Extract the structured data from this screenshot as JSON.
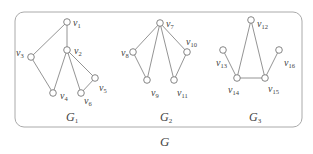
{
  "figure": {
    "caption": "G",
    "frame": {
      "x": 15,
      "y": 12,
      "w": 287,
      "h": 115,
      "r": 9,
      "stroke": "#aaaaaa"
    },
    "components": [
      {
        "name": "G1",
        "label": "G",
        "sub": "1",
        "lx": 66,
        "ly": 121
      },
      {
        "name": "G2",
        "label": "G",
        "sub": "2",
        "lx": 160,
        "ly": 121
      },
      {
        "name": "G3",
        "label": "G",
        "sub": "3",
        "lx": 249,
        "ly": 121
      }
    ],
    "vertices": [
      {
        "id": "v1",
        "sub": "1",
        "x": 67,
        "y": 22,
        "lx": 73,
        "ly": 26
      },
      {
        "id": "v2",
        "sub": "2",
        "x": 67,
        "y": 50,
        "lx": 74,
        "ly": 54
      },
      {
        "id": "v3",
        "sub": "3",
        "x": 31,
        "y": 57,
        "lx": 16,
        "ly": 56
      },
      {
        "id": "v4",
        "sub": "4",
        "x": 53,
        "y": 93,
        "lx": 60,
        "ly": 99
      },
      {
        "id": "v5",
        "sub": "5",
        "x": 95,
        "y": 78,
        "lx": 99,
        "ly": 91
      },
      {
        "id": "v6",
        "sub": "6",
        "x": 81,
        "y": 93,
        "lx": 84,
        "ly": 104
      },
      {
        "id": "v7",
        "sub": "7",
        "x": 160,
        "y": 23,
        "lx": 166,
        "ly": 27
      },
      {
        "id": "v8",
        "sub": "8",
        "x": 133,
        "y": 52,
        "lx": 121,
        "ly": 56
      },
      {
        "id": "v9",
        "sub": "9",
        "x": 147,
        "y": 80,
        "lx": 151,
        "ly": 96
      },
      {
        "id": "v10",
        "sub": "10",
        "x": 187,
        "y": 52,
        "lx": 186,
        "ly": 45
      },
      {
        "id": "v11",
        "sub": "11",
        "x": 174,
        "y": 80,
        "lx": 177,
        "ly": 96
      },
      {
        "id": "v12",
        "sub": "12",
        "x": 251,
        "y": 20,
        "lx": 257,
        "ly": 27
      },
      {
        "id": "v13",
        "sub": "13",
        "x": 223,
        "y": 50,
        "lx": 216,
        "ly": 66
      },
      {
        "id": "v14",
        "sub": "14",
        "x": 237,
        "y": 78,
        "lx": 228,
        "ly": 93
      },
      {
        "id": "v15",
        "sub": "15",
        "x": 265,
        "y": 78,
        "lx": 268,
        "ly": 92
      },
      {
        "id": "v16",
        "sub": "16",
        "x": 279,
        "y": 50,
        "lx": 284,
        "ly": 66
      }
    ],
    "edges": [
      [
        "v1",
        "v3"
      ],
      [
        "v1",
        "v2"
      ],
      [
        "v3",
        "v4"
      ],
      [
        "v2",
        "v4"
      ],
      [
        "v2",
        "v6"
      ],
      [
        "v2",
        "v5"
      ],
      [
        "v5",
        "v6"
      ],
      [
        "v7",
        "v8"
      ],
      [
        "v7",
        "v9"
      ],
      [
        "v7",
        "v11"
      ],
      [
        "v7",
        "v10"
      ],
      [
        "v8",
        "v9"
      ],
      [
        "v10",
        "v11"
      ],
      [
        "v12",
        "v14"
      ],
      [
        "v12",
        "v15"
      ],
      [
        "v13",
        "v14"
      ],
      [
        "v14",
        "v15"
      ],
      [
        "v15",
        "v16"
      ]
    ],
    "style": {
      "line": "#888888",
      "node_fill": "#ffffff",
      "node_stroke": "#777777",
      "node_r": 3.3
    }
  }
}
